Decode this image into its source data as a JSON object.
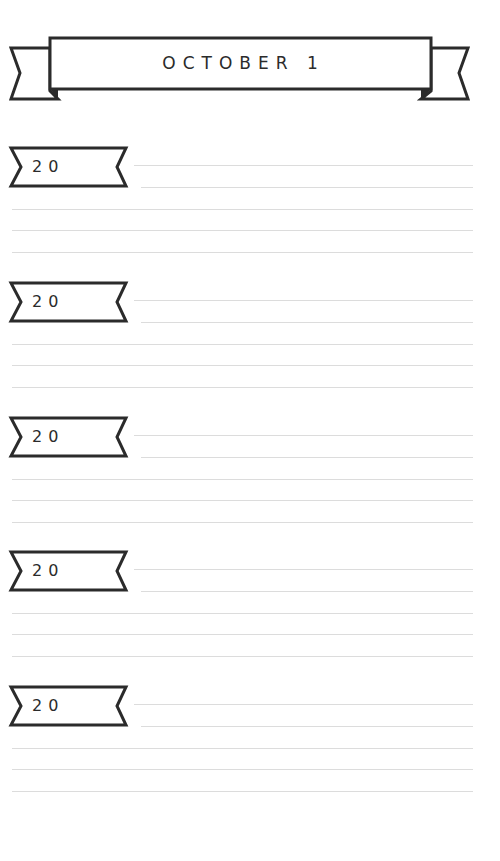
{
  "page": {
    "title": "OCTOBER 1",
    "colors": {
      "ink": "#2b2b2b",
      "rule": "#dcdcdc",
      "paper": "#ffffff"
    }
  },
  "entries": [
    {
      "year_label": "20",
      "lines": 5
    },
    {
      "year_label": "20",
      "lines": 5
    },
    {
      "year_label": "20",
      "lines": 5
    },
    {
      "year_label": "20",
      "lines": 5
    },
    {
      "year_label": "20",
      "lines": 5
    }
  ]
}
